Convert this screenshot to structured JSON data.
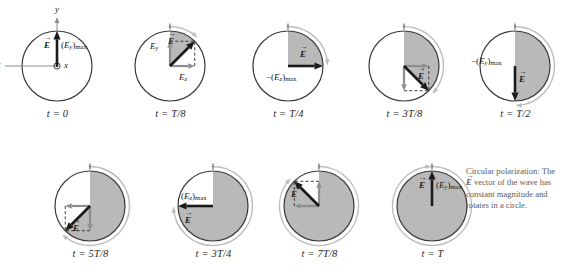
{
  "figure": {
    "caption_line1": "Circular polarization: The",
    "caption_line2_vec": "E",
    "caption_line2_rest": " vector of the wave has",
    "caption_line3": "constant magnitude and",
    "caption_line4": "rotates in a circle.",
    "colors": {
      "shade": "#b9b9b9",
      "circle_stroke": "#3a3a3a",
      "outer_arc": "#bdbdbd",
      "vector": "#1a1a1a",
      "component": "#8e8e8e",
      "axis": "#8e8e8e",
      "caption_text": "#5c5c5c"
    },
    "panels": [
      {
        "id": "t0",
        "time_label": "t = 0",
        "angle_deg": 90,
        "shaded_sweep_deg": 0,
        "show_axes": true,
        "show_components": false,
        "show_outer_arc": false,
        "axis_labels": {
          "y": "y",
          "z": "z",
          "x": "x"
        },
        "vector_label": "E",
        "magnitude_label": "(Ey)max",
        "magnitude_parts": {
          "pre": "(",
          "sym": "E",
          "sub": "y",
          "post": ")",
          "max": "max"
        },
        "magnitude_sign": ""
      },
      {
        "id": "tT8",
        "time_label": "t = T/8",
        "angle_deg": 45,
        "shaded_sweep_deg": 45,
        "show_axes": false,
        "show_components": true,
        "show_outer_arc": true,
        "vector_label": "E",
        "comp_y_label": "Ey",
        "comp_z_label": "Ez",
        "comp_parts": {
          "y": {
            "sym": "E",
            "sub": "y"
          },
          "z": {
            "sym": "E",
            "sub": "z"
          }
        }
      },
      {
        "id": "tT4",
        "time_label": "t = T/4",
        "angle_deg": 0,
        "shaded_sweep_deg": 90,
        "show_axes": false,
        "show_components": false,
        "show_outer_arc": true,
        "vector_label": "E",
        "magnitude_label": "−(Ez)max",
        "magnitude_parts": {
          "pre": "(",
          "sym": "E",
          "sub": "z",
          "post": ")",
          "max": "max"
        },
        "magnitude_sign": "−"
      },
      {
        "id": "t3T8",
        "time_label": "t = 3T/8",
        "angle_deg": -45,
        "shaded_sweep_deg": 135,
        "show_axes": false,
        "show_components": true,
        "show_outer_arc": true,
        "vector_label": "E"
      },
      {
        "id": "tT2",
        "time_label": "t = T/2",
        "angle_deg": -90,
        "shaded_sweep_deg": 180,
        "show_axes": false,
        "show_components": false,
        "show_outer_arc": true,
        "vector_label": "E",
        "magnitude_label": "−(Ey)max",
        "magnitude_parts": {
          "pre": "(",
          "sym": "E",
          "sub": "y",
          "post": ")",
          "max": "max"
        },
        "magnitude_sign": "−"
      },
      {
        "id": "t5T8",
        "time_label": "t = 5T/8",
        "angle_deg": -135,
        "shaded_sweep_deg": 225,
        "show_axes": false,
        "show_components": true,
        "show_outer_arc": true,
        "vector_label": "E"
      },
      {
        "id": "t3T4",
        "time_label": "t = 3T/4",
        "angle_deg": 180,
        "shaded_sweep_deg": 270,
        "show_axes": false,
        "show_components": false,
        "show_outer_arc": true,
        "vector_label": "E",
        "magnitude_label": "(Ez)max",
        "magnitude_parts": {
          "pre": "(",
          "sym": "E",
          "sub": "z",
          "post": ")",
          "max": "max"
        },
        "magnitude_sign": ""
      },
      {
        "id": "t7T8",
        "time_label": "t = 7T/8",
        "angle_deg": 135,
        "shaded_sweep_deg": 315,
        "show_axes": false,
        "show_components": true,
        "show_outer_arc": true,
        "vector_label": "E"
      },
      {
        "id": "tT",
        "time_label": "t = T",
        "angle_deg": 90,
        "shaded_sweep_deg": 360,
        "show_axes": false,
        "show_components": false,
        "show_outer_arc": true,
        "vector_label": "E",
        "magnitude_label": "(Ey)max",
        "magnitude_parts": {
          "pre": "(",
          "sym": "E",
          "sub": "y",
          "post": ")",
          "max": "max"
        },
        "magnitude_sign": ""
      }
    ]
  }
}
